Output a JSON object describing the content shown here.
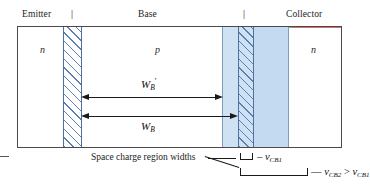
{
  "figure": {
    "type": "semiconductor-bjt-base-width-modulation-diagram",
    "regions": [
      {
        "name": "emitter",
        "label": "Emitter",
        "carrier": "n"
      },
      {
        "name": "base",
        "label": "Base",
        "carrier": "p"
      },
      {
        "name": "collector",
        "label": "Collector",
        "carrier": "n"
      }
    ],
    "boundary_ticks": [
      "|",
      "|"
    ],
    "dimensions": [
      {
        "name": "base-width-modulated",
        "symbol": "W",
        "subscript": "B",
        "prime": "'"
      },
      {
        "name": "base-width-nominal",
        "symbol": "W",
        "subscript": "B",
        "prime": ""
      }
    ],
    "callouts": {
      "space_charge_label": "Space charge region widths",
      "bias_small": {
        "symbol": "v",
        "subscript": "CB1",
        "dash": "–"
      },
      "bias_large": {
        "text_left": "v",
        "sub_left": "CB2",
        "relation": ">",
        "text_right": "v",
        "sub_right": "CB1",
        "dash": "—"
      }
    },
    "colors": {
      "depletion_fill": "#c3daf0",
      "depletion_fill_light": "#cfe2f4",
      "hatch_stroke": "#5b7fb0",
      "outline": "#4a4a4a",
      "text": "#1c1c1c"
    }
  }
}
